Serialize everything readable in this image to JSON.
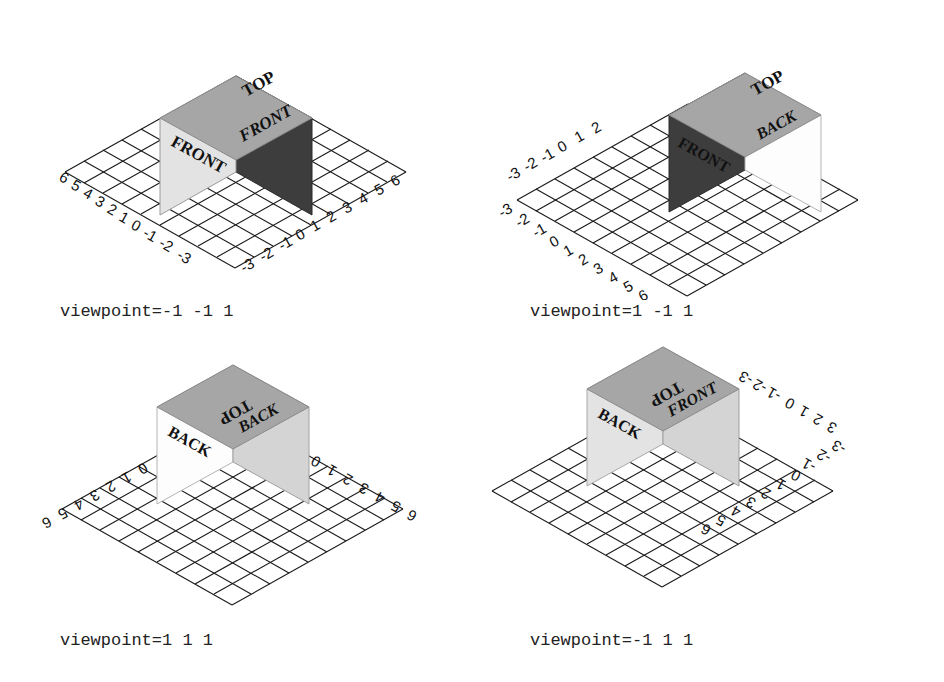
{
  "figure": {
    "title": "",
    "background_color": "#ffffff",
    "panel_count": 4,
    "layout": "2x2"
  },
  "colors": {
    "top_face": "#a6a6a6",
    "left_face_light": "#e3e3e3",
    "right_face_dark": "#3d3d3d",
    "right_face_light": "#d4d4d4",
    "white_face": "#fdfdfd",
    "grid_stroke": "#1a1a1a",
    "text": "#111111",
    "caption": "#222222"
  },
  "panels": [
    {
      "id": "panel-top-left",
      "caption": "viewpoint=-1 -1 1",
      "viewpoint": [
        -1,
        -1,
        1
      ],
      "cube_faces": [
        {
          "name": "top",
          "label": "TOP",
          "color": "#a6a6a6"
        },
        {
          "name": "left",
          "label": "FRONT",
          "color": "#e3e3e3"
        },
        {
          "name": "right",
          "label": "FRONT",
          "color": "#3d3d3d"
        }
      ],
      "axes": [
        {
          "name": "left-axis",
          "ticks": [
            "6",
            "5",
            "4",
            "3",
            "2",
            "1",
            "0",
            "-1",
            "-2",
            "-3"
          ]
        },
        {
          "name": "right-axis",
          "ticks": [
            "-3",
            "-2",
            "-1",
            "0",
            "1",
            "2",
            "3",
            "4",
            "5",
            "6"
          ]
        }
      ]
    },
    {
      "id": "panel-top-right",
      "caption": "viewpoint=1 -1 1",
      "viewpoint": [
        1,
        -1,
        1
      ],
      "cube_faces": [
        {
          "name": "top",
          "label": "TOP",
          "color": "#a6a6a6"
        },
        {
          "name": "left",
          "label": "FRONT",
          "color": "#3d3d3d"
        },
        {
          "name": "right",
          "label": "BACK",
          "color": "#fdfdfd"
        }
      ],
      "axes": [
        {
          "name": "upper-axis",
          "ticks": [
            "-3",
            "-2",
            "-1",
            "0",
            "1",
            "2"
          ]
        },
        {
          "name": "lower-axis",
          "ticks": [
            "-3",
            "-2",
            "-1",
            "0",
            "1",
            "2",
            "3",
            "4",
            "5",
            "6"
          ]
        }
      ]
    },
    {
      "id": "panel-bottom-left",
      "caption": "viewpoint=1 1 1",
      "viewpoint": [
        1,
        1,
        1
      ],
      "cube_faces": [
        {
          "name": "top",
          "label": "TOP",
          "color": "#a6a6a6"
        },
        {
          "name": "left",
          "label": "BACK",
          "color": "#fdfdfd"
        },
        {
          "name": "right",
          "label": "BACK",
          "color": "#d4d4d4"
        }
      ],
      "axes": [
        {
          "name": "left-axis",
          "ticks": [
            "6",
            "5",
            "4",
            "3",
            "2",
            "1",
            "0"
          ]
        },
        {
          "name": "right-axis",
          "ticks": [
            "0",
            "1",
            "2",
            "3",
            "4",
            "5",
            "6"
          ]
        }
      ]
    },
    {
      "id": "panel-bottom-right",
      "caption": "viewpoint=-1 1 1",
      "viewpoint": [
        -1,
        1,
        1
      ],
      "cube_faces": [
        {
          "name": "top",
          "label": "TOP",
          "color": "#a6a6a6"
        },
        {
          "name": "left",
          "label": "BACK",
          "color": "#e3e3e3"
        },
        {
          "name": "right",
          "label": "FRONT",
          "color": "#d4d4d4"
        }
      ],
      "axes": [
        {
          "name": "upper-axis",
          "ticks": [
            "-3",
            "-2",
            "-1",
            "0",
            "1",
            "2",
            "3"
          ]
        },
        {
          "name": "lower-axis",
          "ticks": [
            "-3",
            "-2",
            "-1",
            "0",
            "1",
            "2",
            "3",
            "4",
            "5",
            "6"
          ]
        }
      ]
    }
  ]
}
